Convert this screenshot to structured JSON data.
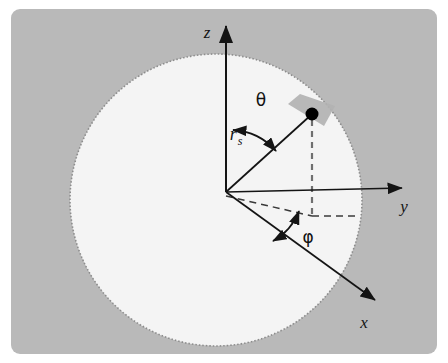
{
  "figure": {
    "name": "spherical-coordinate-system-diagram",
    "canvas": {
      "width": 448,
      "height": 363
    },
    "colors": {
      "page_background": "#ffffff",
      "panel_background": "#b9b9b9",
      "sphere_fill": "#f4f4f4",
      "sphere_outline": "#8d8d8d",
      "line": "#1a1a1a",
      "patch_fill": "#b2b2b2",
      "point_fill": "#000000",
      "dashed_line": "#6f6f6f"
    },
    "panel": {
      "x": 11,
      "y": 9,
      "width": 426,
      "height": 345,
      "corner_radius": 9
    }
  },
  "sphere": {
    "label": "sphere-outline",
    "center_x": 216,
    "center_y": 200,
    "radius": 146,
    "outline_style": "dotted"
  },
  "origin": {
    "x": 226,
    "y": 192
  },
  "axes": [
    {
      "id": "z-axis",
      "label": "z",
      "label_x": 208,
      "label_y": 32,
      "from_x": 226,
      "from_y": 192,
      "to_x": 226,
      "to_y": 25,
      "arrow": true
    },
    {
      "id": "y-axis",
      "label": "y",
      "label_x": 404,
      "label_y": 209,
      "from_x": 226,
      "from_y": 192,
      "to_x": 404,
      "to_y": 188,
      "arrow": true
    },
    {
      "id": "x-axis",
      "label": "x",
      "label_x": 363,
      "label_y": 325,
      "from_x": 226,
      "from_y": 192,
      "to_x": 377,
      "to_y": 302,
      "arrow": true
    }
  ],
  "radius_vector": {
    "id": "radius-vector",
    "label": "r",
    "subscript": "s",
    "label_x": 239,
    "label_y": 142,
    "from_x": 226,
    "from_y": 192,
    "to_x": 312,
    "to_y": 114
  },
  "angles": [
    {
      "id": "theta-angle",
      "label": "θ",
      "label_x": 259,
      "label_y": 106,
      "arc_radius": 60,
      "double_headed": true,
      "between": [
        "z-axis",
        "radius-vector"
      ]
    },
    {
      "id": "phi-angle",
      "label": "φ",
      "label_x": 307,
      "label_y": 240,
      "arc_radius": 60,
      "double_headed": true,
      "between": [
        "x-axis-projection",
        "y-dashed-projection"
      ]
    }
  ],
  "point": {
    "id": "point-marker",
    "x": 312,
    "y": 114,
    "radius": 6
  },
  "surface_patch": {
    "id": "surface-area-element",
    "points": "288,104 300,94 335,106 324,126"
  },
  "dashed_lines": [
    {
      "id": "vertical-drop-line",
      "from_x": 312,
      "from_y": 118,
      "to_x": 312,
      "to_y": 216
    },
    {
      "id": "projection-line-to-xy",
      "from_x": 226,
      "from_y": 196,
      "to_x": 356,
      "to_y": 216
    },
    {
      "id": "projection-line-origin-to-foot",
      "from_x": 226,
      "from_y": 196,
      "to_x": 312,
      "to_y": 216
    }
  ]
}
